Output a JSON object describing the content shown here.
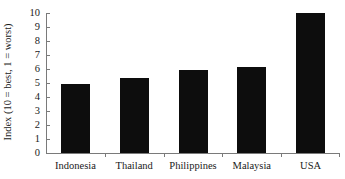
{
  "chart_data": {
    "type": "bar",
    "title": "",
    "xlabel": "",
    "ylabel": "Index (10 = best, 1 = worst)",
    "categories": [
      "Indonesia",
      "Thailand",
      "Philippines",
      "Malaysia",
      "USA"
    ],
    "values": [
      4.9,
      5.35,
      5.9,
      6.15,
      10.0
    ],
    "ylim": [
      0,
      10
    ],
    "yticks": [
      0,
      1,
      2,
      3,
      4,
      5,
      6,
      7,
      8,
      9,
      10
    ],
    "ytick_labels": [
      "0",
      "1",
      "2",
      "3",
      "4",
      "5",
      "6",
      "7",
      "8",
      "9",
      "10"
    ],
    "grid": false,
    "legend": null,
    "bar_color": "#0d0d0d",
    "axis_color": "#7a7a7a",
    "background": "#ffffff"
  }
}
